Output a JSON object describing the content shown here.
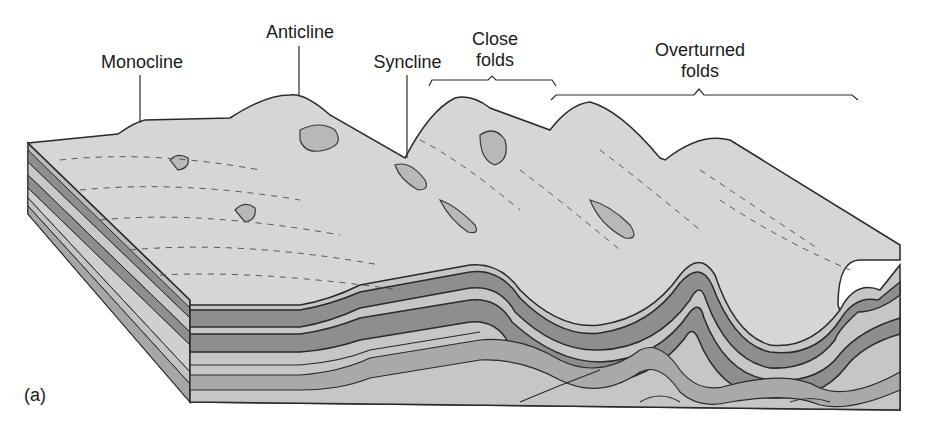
{
  "figure": {
    "panel_label": "(a)",
    "labels": {
      "monocline": "Monocline",
      "anticline": "Anticline",
      "syncline": "Syncline",
      "close_folds_line1": "Close",
      "close_folds_line2": "folds",
      "overturned_folds_line1": "Overturned",
      "overturned_folds_line2": "folds"
    },
    "colors": {
      "surface": "#d6d6d6",
      "dark_layer": "#8e8e8e",
      "light_layer": "#c9c9c9",
      "mid_layer": "#a9a9a9",
      "outline": "#2a2a2a"
    }
  }
}
